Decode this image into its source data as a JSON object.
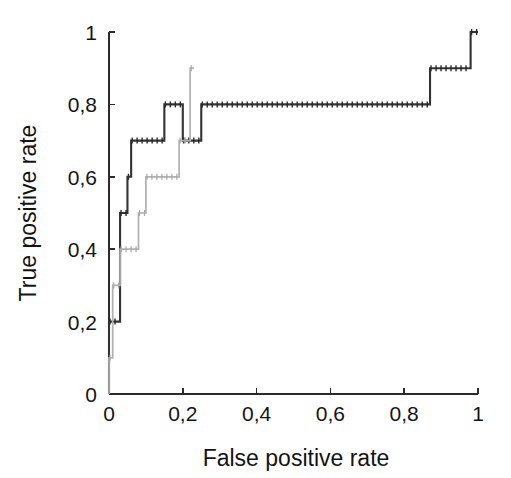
{
  "chart_data": {
    "type": "line",
    "title": "",
    "subtitle": "",
    "xlabel": "False positive rate",
    "ylabel": "True positive rate",
    "xlim": [
      0,
      1
    ],
    "ylim": [
      0,
      1
    ],
    "grid": false,
    "legend": "none",
    "decimal_separator": ",",
    "x_tick_labels": [
      "0",
      "0,2",
      "0,4",
      "0,6",
      "0,8",
      "1"
    ],
    "x_tick_values": [
      0,
      0.2,
      0.4,
      0.6,
      0.8,
      1
    ],
    "y_tick_labels": [
      "0",
      "0,2",
      "0,4",
      "0,6",
      "0,8",
      "1"
    ],
    "y_tick_values": [
      0,
      0.2,
      0.4,
      0.6,
      0.8,
      1
    ],
    "series": [
      {
        "name": "roc-curve-dark",
        "color": "#333333",
        "style": "step-marked",
        "points": [
          [
            0.0,
            0.0
          ],
          [
            0.0,
            0.2
          ],
          [
            0.03,
            0.2
          ],
          [
            0.03,
            0.5
          ],
          [
            0.05,
            0.5
          ],
          [
            0.05,
            0.6
          ],
          [
            0.06,
            0.6
          ],
          [
            0.06,
            0.7
          ],
          [
            0.15,
            0.7
          ],
          [
            0.15,
            0.8
          ],
          [
            0.2,
            0.8
          ],
          [
            0.2,
            0.7
          ],
          [
            0.25,
            0.7
          ],
          [
            0.25,
            0.8
          ],
          [
            0.87,
            0.8
          ],
          [
            0.87,
            0.9
          ],
          [
            0.98,
            0.9
          ],
          [
            0.98,
            1.0
          ],
          [
            1.0,
            1.0
          ]
        ]
      },
      {
        "name": "roc-curve-light",
        "color": "#b0b0b0",
        "style": "step-marked",
        "points": [
          [
            0.0,
            0.0
          ],
          [
            0.0,
            0.1
          ],
          [
            0.01,
            0.1
          ],
          [
            0.01,
            0.3
          ],
          [
            0.03,
            0.3
          ],
          [
            0.03,
            0.4
          ],
          [
            0.08,
            0.4
          ],
          [
            0.08,
            0.5
          ],
          [
            0.1,
            0.5
          ],
          [
            0.1,
            0.6
          ],
          [
            0.19,
            0.6
          ],
          [
            0.19,
            0.7
          ],
          [
            0.22,
            0.7
          ],
          [
            0.22,
            0.9
          ],
          [
            0.23,
            0.9
          ]
        ]
      }
    ]
  },
  "figure": {
    "background_color": "#ffffff",
    "axis_color": "#2b2b2b"
  }
}
